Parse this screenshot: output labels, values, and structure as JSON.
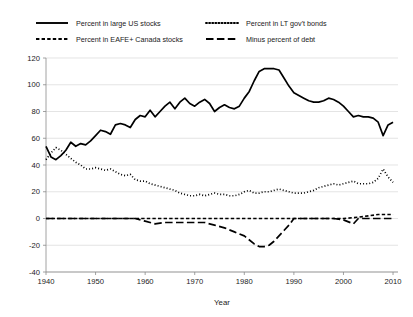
{
  "chart_data": {
    "type": "line",
    "title": "",
    "xlabel": "Year",
    "ylabel": "",
    "xlim": [
      1940,
      2011
    ],
    "ylim": [
      -40,
      120
    ],
    "grid": true,
    "legend_position": "top",
    "x_ticks": [
      "1940",
      "1950",
      "1960",
      "1970",
      "1980",
      "1990",
      "2000",
      "2010"
    ],
    "x_tick_values": [
      1940,
      1950,
      1960,
      1970,
      1980,
      1990,
      2000,
      2010
    ],
    "y_ticks": [
      "120",
      "100",
      "80",
      "60",
      "40",
      "20",
      "0",
      "-20",
      "-40"
    ],
    "y_tick_values": [
      120,
      100,
      80,
      60,
      40,
      20,
      0,
      -20,
      -40
    ],
    "series": [
      {
        "name": "Percent in large US stocks",
        "style": "solid",
        "color": "#000000",
        "width": 1.7,
        "x": [
          1940,
          1941,
          1942,
          1943,
          1944,
          1945,
          1946,
          1947,
          1948,
          1949,
          1950,
          1951,
          1952,
          1953,
          1954,
          1955,
          1956,
          1957,
          1958,
          1959,
          1960,
          1961,
          1962,
          1963,
          1964,
          1965,
          1966,
          1967,
          1968,
          1969,
          1970,
          1971,
          1972,
          1973,
          1974,
          1975,
          1976,
          1977,
          1978,
          1979,
          1980,
          1981,
          1982,
          1983,
          1984,
          1985,
          1986,
          1987,
          1988,
          1989,
          1990,
          1991,
          1992,
          1993,
          1994,
          1995,
          1996,
          1997,
          1998,
          1999,
          2000,
          2001,
          2002,
          2003,
          2004,
          2005,
          2006,
          2007,
          2008,
          2009,
          2010
        ],
        "values": [
          54,
          46,
          44,
          47,
          51,
          57,
          54,
          56,
          55,
          58,
          62,
          66,
          65,
          63,
          70,
          71,
          70,
          68,
          74,
          77,
          76,
          81,
          76,
          80,
          84,
          87,
          82,
          87,
          90,
          86,
          84,
          87,
          89,
          86,
          80,
          83,
          85,
          83,
          82,
          84,
          90,
          95,
          103,
          110,
          112,
          112,
          112,
          111,
          105,
          99,
          94,
          92,
          90,
          88,
          87,
          87,
          88,
          90,
          89,
          87,
          84,
          80,
          76,
          77,
          76,
          76,
          75,
          72,
          62,
          70,
          72
        ]
      },
      {
        "name": "Percent in LT gov't bonds",
        "style": "dotted",
        "color": "#000000",
        "width": 1.7,
        "x": [
          1940,
          1941,
          1942,
          1943,
          1944,
          1945,
          1946,
          1947,
          1948,
          1949,
          1950,
          1951,
          1952,
          1953,
          1954,
          1955,
          1956,
          1957,
          1958,
          1959,
          1960,
          1961,
          1962,
          1963,
          1964,
          1965,
          1966,
          1967,
          1968,
          1969,
          1970,
          1971,
          1972,
          1973,
          1974,
          1975,
          1976,
          1977,
          1978,
          1979,
          1980,
          1981,
          1982,
          1983,
          1984,
          1985,
          1986,
          1987,
          1988,
          1989,
          1990,
          1991,
          1992,
          1993,
          1994,
          1995,
          1996,
          1997,
          1998,
          1999,
          2000,
          2001,
          2002,
          2003,
          2004,
          2005,
          2006,
          2007,
          2008,
          2009,
          2010
        ],
        "values": [
          44,
          49,
          53,
          51,
          48,
          45,
          42,
          40,
          37,
          37,
          38,
          37,
          36,
          37,
          35,
          33,
          32,
          33,
          29,
          28,
          28,
          26,
          25,
          24,
          23,
          22,
          21,
          19,
          18,
          17,
          17,
          18,
          17,
          18,
          19,
          18,
          18,
          17,
          17,
          18,
          20,
          21,
          19,
          19,
          20,
          20,
          21,
          22,
          21,
          20,
          19,
          19,
          19,
          20,
          21,
          23,
          24,
          25,
          26,
          25,
          26,
          27,
          28,
          26,
          26,
          26,
          27,
          30,
          37,
          31,
          27
        ]
      },
      {
        "name": "Percent in EAFE+ Canada stocks",
        "style": "dashed-fine",
        "color": "#000000",
        "width": 1.7,
        "x": [
          1940,
          1950,
          1955,
          1960,
          1965,
          1970,
          1975,
          1980,
          1985,
          1990,
          1995,
          2000,
          2003,
          2005,
          2007,
          2008,
          2009,
          2010
        ],
        "values": [
          0,
          0,
          0,
          0,
          0,
          0,
          0,
          0,
          0,
          0,
          0,
          0,
          1,
          2,
          3,
          3,
          3,
          3
        ]
      },
      {
        "name": "Minus percent of debt",
        "style": "dashed-long",
        "color": "#000000",
        "width": 1.7,
        "x": [
          1940,
          1945,
          1950,
          1955,
          1958,
          1960,
          1962,
          1964,
          1966,
          1968,
          1970,
          1972,
          1974,
          1976,
          1978,
          1980,
          1982,
          1983,
          1984,
          1985,
          1986,
          1987,
          1988,
          1989,
          1990,
          1992,
          1995,
          1998,
          2000,
          2002,
          2003,
          2004,
          2006,
          2008,
          2010
        ],
        "values": [
          0,
          0,
          0,
          0,
          0,
          -2,
          -4,
          -3,
          -3,
          -3,
          -3,
          -3,
          -5,
          -7,
          -10,
          -13,
          -19,
          -21,
          -21,
          -20,
          -17,
          -13,
          -9,
          -5,
          0,
          0,
          0,
          0,
          -1,
          -4,
          0,
          0,
          0,
          0,
          0
        ]
      }
    ]
  },
  "legend": {
    "items": [
      {
        "label": "Percent in large US stocks",
        "style": "solid"
      },
      {
        "label": "Percent in LT gov't bonds",
        "style": "dotted"
      },
      {
        "label": "Percent in EAFE+ Canada stocks",
        "style": "dashed-fine"
      },
      {
        "label": "Minus percent of debt",
        "style": "dashed-long"
      }
    ]
  }
}
